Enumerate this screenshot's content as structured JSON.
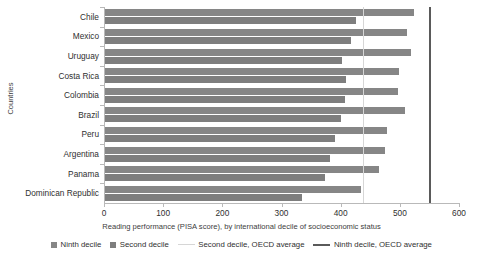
{
  "chart_data": {
    "type": "bar",
    "orientation": "horizontal",
    "title": "",
    "xlabel": "Reading performance (PISA score), by international decile of socioeconomic status",
    "ylabel": "Countries",
    "xlim": [
      0,
      600
    ],
    "xticks": [
      0,
      100,
      200,
      300,
      400,
      500,
      600
    ],
    "grid": false,
    "legend_position": "bottom",
    "categories": [
      "Chile",
      "Mexico",
      "Uruguay",
      "Costa Rica",
      "Colombia",
      "Brazil",
      "Peru",
      "Argentina",
      "Panama",
      "Dominican Republic"
    ],
    "series": [
      {
        "name": "Ninth decile",
        "color": "#868686",
        "values": [
          522,
          510,
          517,
          497,
          496,
          507,
          477,
          474,
          463,
          432
        ]
      },
      {
        "name": "Second decile",
        "color": "#7e7e7e",
        "values": [
          425,
          415,
          400,
          408,
          405,
          399,
          389,
          381,
          371,
          333
        ]
      }
    ],
    "reference_lines": [
      {
        "name": "Second decile, OECD average",
        "value": 437,
        "color": "#d6d6d6",
        "style": "thin"
      },
      {
        "name": "Ninth decile, OECD average",
        "value": 550,
        "color": "#5a5a5a",
        "style": "thick"
      }
    ]
  },
  "legend": {
    "items": [
      {
        "label": "Ninth decile",
        "kind": "swatch"
      },
      {
        "label": "Second decile",
        "kind": "swatch"
      },
      {
        "label": "Second decile, OECD average",
        "kind": "line"
      },
      {
        "label": "Ninth decile, OECD average",
        "kind": "line"
      }
    ]
  },
  "axes": {
    "x_title": "Reading performance (PISA score), by international decile of socioeconomic status",
    "y_title": "Countries",
    "x_tick_labels": [
      "0",
      "100",
      "200",
      "300",
      "400",
      "500",
      "600"
    ]
  }
}
